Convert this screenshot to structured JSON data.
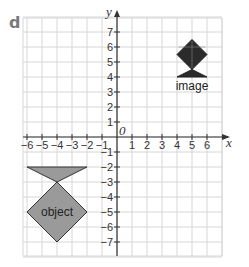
{
  "question_label": "d",
  "axes": {
    "x_label": "x",
    "y_label": "y",
    "origin_label": "0",
    "x_ticks": [
      "-6",
      "-5",
      "-4",
      "-3",
      "-2",
      "-1",
      "1",
      "2",
      "3",
      "4",
      "5",
      "6"
    ],
    "y_ticks": [
      "7",
      "6",
      "5",
      "4",
      "3",
      "2",
      "1",
      "-1",
      "-2",
      "-3",
      "-4",
      "-5",
      "-6",
      "-7"
    ],
    "range": {
      "x": [
        -7,
        7
      ],
      "y": [
        -8,
        8
      ]
    }
  },
  "shapes": {
    "object": {
      "label": "object",
      "fill": "#9a9a9a",
      "triangle": [
        [
          -6,
          -2
        ],
        [
          -2,
          -2
        ],
        [
          -4,
          -3
        ]
      ],
      "diamond": [
        [
          -4,
          -3
        ],
        [
          -2,
          -5
        ],
        [
          -4,
          -7
        ],
        [
          -6,
          -5
        ]
      ]
    },
    "image": {
      "label": "image",
      "fill": "#2b2b2b",
      "triangle": [
        [
          6,
          4
        ],
        [
          4,
          4
        ],
        [
          5,
          4.5
        ]
      ],
      "diamond": [
        [
          5,
          4.5
        ],
        [
          4,
          5.5
        ],
        [
          5,
          6.5
        ],
        [
          6,
          5.5
        ]
      ]
    }
  },
  "colors": {
    "grid": "#d6d6d6",
    "axis": "#333333"
  }
}
